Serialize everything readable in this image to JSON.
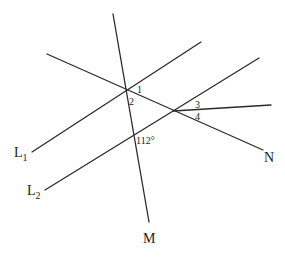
{
  "diagram": {
    "type": "geometry",
    "lines": [
      {
        "id": "L1",
        "label": "L",
        "subscript": "1",
        "from": [
          32,
          152
        ],
        "to": [
          201,
          42
        ]
      },
      {
        "id": "L2",
        "label": "L",
        "subscript": "2",
        "from": [
          45,
          190
        ],
        "to": [
          259,
          58
        ]
      },
      {
        "id": "M",
        "label": "M",
        "from": [
          113,
          14
        ],
        "to": [
          149,
          222
        ]
      },
      {
        "id": "N",
        "label": "N",
        "from": [
          47,
          54
        ],
        "to": [
          263,
          150
        ]
      },
      {
        "id": "ray3",
        "label": "",
        "from": [
          173,
          111
        ],
        "to": [
          271,
          105
        ]
      }
    ],
    "labels": {
      "L1": {
        "main": "L",
        "sub": "1"
      },
      "L2": {
        "main": "L",
        "sub": "2"
      },
      "M": "M",
      "N": "N"
    },
    "angles": {
      "a1": "1",
      "a2": "2",
      "a3": "3",
      "a4": "4",
      "given": "112°"
    }
  }
}
